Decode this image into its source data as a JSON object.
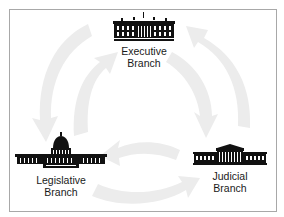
{
  "diagram": {
    "type": "cycle",
    "nodes": [
      {
        "id": "executive",
        "line1": "Executive",
        "line2": "Branch",
        "icon": "white-house-icon"
      },
      {
        "id": "legislative",
        "line1": "Legislative",
        "line2": "Branch",
        "icon": "capitol-building-icon"
      },
      {
        "id": "judicial",
        "line1": "Judicial",
        "line2": "Branch",
        "icon": "supreme-court-icon"
      }
    ],
    "edges": [
      {
        "from": "executive",
        "to": "legislative",
        "style": "outer-arc"
      },
      {
        "from": "legislative",
        "to": "executive",
        "style": "inner-arc"
      },
      {
        "from": "executive",
        "to": "judicial",
        "style": "inner-arc"
      },
      {
        "from": "judicial",
        "to": "executive",
        "style": "outer-arc"
      },
      {
        "from": "legislative",
        "to": "judicial",
        "style": "outer-arc"
      },
      {
        "from": "judicial",
        "to": "legislative",
        "style": "inner-arc"
      }
    ],
    "colors": {
      "arrow": "#ececec",
      "border": "#a8a8a8",
      "text": "#1a1a1a",
      "icon": "#111111"
    }
  }
}
